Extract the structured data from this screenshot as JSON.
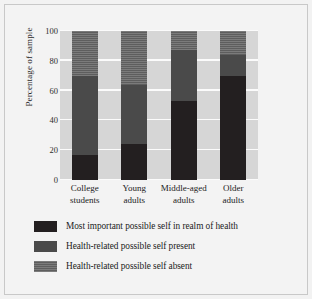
{
  "chart_data": {
    "type": "bar",
    "subtype": "stacked-bar-100",
    "title": "",
    "xlabel": "",
    "ylabel": "Percentage of sample",
    "ylim": [
      0,
      100
    ],
    "yticks": [
      0,
      20,
      40,
      60,
      80,
      100
    ],
    "ytick_labels": [
      "0",
      "20",
      "40",
      "60",
      "80",
      "100"
    ],
    "grid": "horizontal-white",
    "legend_position": "below",
    "categories": [
      "College students",
      "Young adults",
      "Middle-aged adults",
      "Older adults"
    ],
    "category_lines": [
      [
        "College",
        "students"
      ],
      [
        "Young",
        "adults"
      ],
      [
        "Middle-aged",
        "adults"
      ],
      [
        "Older",
        "adults"
      ]
    ],
    "series": [
      {
        "name": "Most important possible self in realm of health",
        "color": "#231f20",
        "values": [
          17,
          24,
          53,
          70
        ]
      },
      {
        "name": "Health-related possible self present",
        "color": "#4a4a4a",
        "values": [
          53,
          40,
          34,
          14
        ]
      },
      {
        "name": "Health-related possible self absent",
        "color": "#5e5e5e",
        "values": [
          30,
          36,
          13,
          16
        ]
      }
    ],
    "cumulative_tops": [
      [
        17,
        70,
        100
      ],
      [
        24,
        64,
        100
      ],
      [
        53,
        87,
        100
      ],
      [
        70,
        84,
        100
      ]
    ],
    "plot_background": "#d6d6d6",
    "figure_background": "#f3f3f3"
  },
  "legend": {
    "items": [
      {
        "label": "Most important possible self in realm of health",
        "swatch": "black"
      },
      {
        "label": "Health-related possible self present",
        "swatch": "mid"
      },
      {
        "label": "Health-related possible self absent",
        "swatch": "light"
      }
    ]
  }
}
